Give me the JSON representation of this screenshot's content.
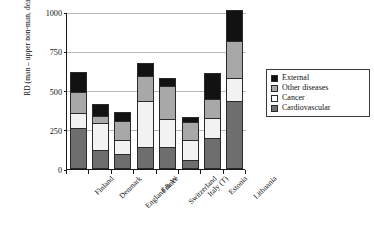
{
  "chart_data": {
    "type": "bar",
    "stacked": true,
    "title": "",
    "xlabel": "",
    "ylabel": "RD (man – upper non-man, deaths per 100,000)",
    "ylim": [
      0,
      1000
    ],
    "yticks": [
      0,
      250,
      500,
      750,
      1000
    ],
    "grid": true,
    "legend_position": "right",
    "categories": [
      "Finland",
      "Denmark",
      "England & W",
      "France",
      "Switzerland",
      "Italy (T)",
      "Estonia",
      "Lithuania"
    ],
    "series": [
      {
        "name": "Cardiovascular",
        "color": "#6e6e6e",
        "values": [
          250,
          110,
          80,
          130,
          130,
          45,
          185,
          420
        ]
      },
      {
        "name": "Cancer",
        "color": "#ffffff",
        "values": [
          95,
          170,
          90,
          290,
          175,
          125,
          125,
          145
        ]
      },
      {
        "name": "Other diseases",
        "color": "#a8a8a8",
        "values": [
          130,
          45,
          125,
          160,
          210,
          115,
          125,
          235
        ]
      },
      {
        "name": "External",
        "color": "#121212",
        "values": [
          130,
          75,
          55,
          80,
          55,
          35,
          165,
          200
        ]
      }
    ],
    "totals": [
      390,
      355,
      170,
      400,
      285,
      155,
      600,
      1000
    ]
  },
  "legend": {
    "items": [
      {
        "label": "External",
        "key": "external"
      },
      {
        "label": "Other diseases",
        "key": "other"
      },
      {
        "label": "Cancer",
        "key": "cancer"
      },
      {
        "label": "Cardiovascular",
        "key": "cardio"
      }
    ]
  }
}
